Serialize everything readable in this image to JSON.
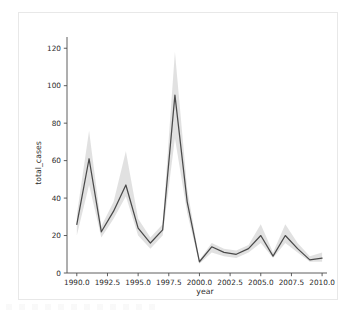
{
  "figure": {
    "background_color": "#ffffff",
    "frame_border_color": "#e8e8e8",
    "line_color": "#4a4a4a",
    "band_color": "#8c8c8c",
    "axis_color": "#4d4d4d"
  },
  "chart_data": {
    "type": "line",
    "title": "",
    "xlabel": "year",
    "ylabel": "total_cases",
    "xlim": [
      1989.2,
      2010.4
    ],
    "ylim": [
      0,
      126
    ],
    "grid": false,
    "legend": null,
    "xticks": [
      "1990.0",
      "1992.5",
      "1995.0",
      "1997.5",
      "2000.0",
      "2002.5",
      "2005.0",
      "2007.5",
      "2010.0"
    ],
    "xtick_values": [
      1990.0,
      1992.5,
      1995.0,
      1997.5,
      2000.0,
      2002.5,
      2005.0,
      2007.5,
      2010.0
    ],
    "yticks": [
      "0",
      "20",
      "40",
      "60",
      "80",
      "100",
      "120"
    ],
    "ytick_values": [
      0,
      20,
      40,
      60,
      80,
      100,
      120
    ],
    "series": [
      {
        "name": "total_cases",
        "x": [
          1990,
          1991,
          1992,
          1993,
          1994,
          1995,
          1996,
          1997,
          1998,
          1999,
          2000,
          2001,
          2002,
          2003,
          2004,
          2005,
          2006,
          2007,
          2008,
          2009,
          2010
        ],
        "values": [
          26,
          61,
          22,
          33,
          47,
          24,
          16,
          23,
          95,
          38,
          6,
          14,
          11,
          10,
          13,
          20,
          9,
          20,
          13,
          7,
          8
        ],
        "ci_lower": [
          20,
          47,
          19,
          29,
          41,
          20,
          13,
          20,
          72,
          32,
          5,
          11,
          9,
          8,
          11,
          16,
          8,
          16,
          11,
          6,
          6
        ],
        "ci_upper": [
          31,
          76,
          25,
          38,
          65,
          29,
          19,
          26,
          118,
          45,
          7,
          16,
          13,
          12,
          15,
          26,
          11,
          26,
          16,
          9,
          11
        ]
      }
    ]
  }
}
